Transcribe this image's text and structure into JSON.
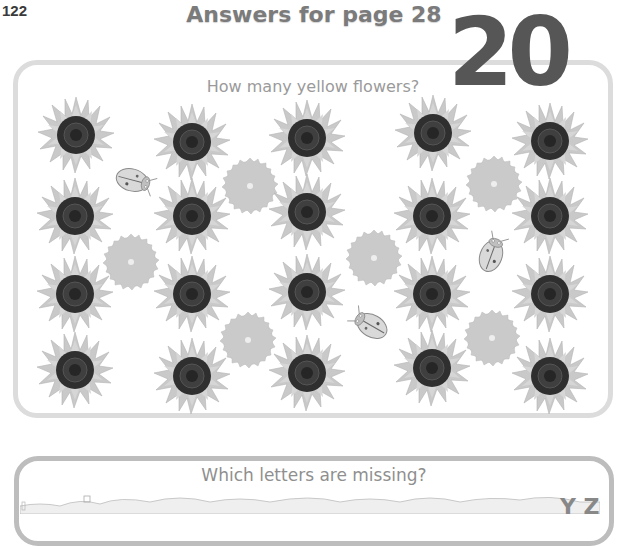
{
  "page": {
    "number": "122",
    "title": "Answers for page 28"
  },
  "question1": {
    "prompt": "How many yellow flowers?",
    "answer": "20",
    "sunflowers": [
      {
        "x": 76,
        "y": 135
      },
      {
        "x": 192,
        "y": 142
      },
      {
        "x": 307,
        "y": 138
      },
      {
        "x": 433,
        "y": 133
      },
      {
        "x": 550,
        "y": 141
      },
      {
        "x": 75,
        "y": 216
      },
      {
        "x": 192,
        "y": 216
      },
      {
        "x": 307,
        "y": 212
      },
      {
        "x": 432,
        "y": 216
      },
      {
        "x": 550,
        "y": 216
      },
      {
        "x": 75,
        "y": 294
      },
      {
        "x": 192,
        "y": 294
      },
      {
        "x": 307,
        "y": 292
      },
      {
        "x": 432,
        "y": 294
      },
      {
        "x": 550,
        "y": 294
      },
      {
        "x": 75,
        "y": 370
      },
      {
        "x": 192,
        "y": 376
      },
      {
        "x": 307,
        "y": 373
      },
      {
        "x": 432,
        "y": 368
      },
      {
        "x": 550,
        "y": 376
      }
    ],
    "other_flowers": [
      {
        "x": 250,
        "y": 186
      },
      {
        "x": 131,
        "y": 262
      },
      {
        "x": 374,
        "y": 258
      },
      {
        "x": 494,
        "y": 184
      },
      {
        "x": 248,
        "y": 340
      },
      {
        "x": 492,
        "y": 338
      }
    ],
    "ladybirds": [
      {
        "x": 132,
        "y": 180,
        "rotate": 15
      },
      {
        "x": 491,
        "y": 256,
        "rotate": -70
      },
      {
        "x": 372,
        "y": 326,
        "rotate": -150
      }
    ]
  },
  "question2": {
    "prompt": "Which letters are missing?",
    "visible_letters": "Y Z"
  },
  "colors": {
    "title": "#7b7b7b",
    "answer": "#565656",
    "panel_border": "#dcdcdc",
    "petal": "#c4c4c4",
    "center": "#3a3a3a"
  }
}
